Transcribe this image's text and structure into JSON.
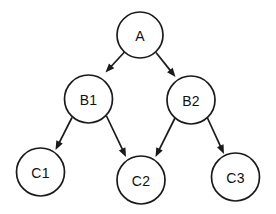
{
  "diagram": {
    "background_color": "#ffffff",
    "stroke_color": "#1a1a1a",
    "label_color": "#111111",
    "node_fill": "#ffffff",
    "stroke_width": 1.7,
    "nodes": [
      {
        "id": "A",
        "label": "A",
        "cx": 140,
        "cy": 35,
        "r": 23
      },
      {
        "id": "B1",
        "label": "B1",
        "cx": 88.5,
        "cy": 99,
        "r": 24
      },
      {
        "id": "B2",
        "label": "B2",
        "cx": 191,
        "cy": 100,
        "r": 24
      },
      {
        "id": "C1",
        "label": "C1",
        "cx": 40.5,
        "cy": 172,
        "r": 24
      },
      {
        "id": "C2",
        "label": "C2",
        "cx": 141,
        "cy": 180,
        "r": 24
      },
      {
        "id": "C3",
        "label": "C3",
        "cx": 235.5,
        "cy": 177,
        "r": 24
      }
    ],
    "edges": [
      {
        "id": "a-b1",
        "from": "A",
        "to": "B1",
        "x1": 124.5,
        "y1": 52,
        "x2": 105.5,
        "y2": 72.5
      },
      {
        "id": "a-b2",
        "from": "A",
        "to": "B2",
        "x1": 156,
        "y1": 52.5,
        "x2": 175.5,
        "y2": 77
      },
      {
        "id": "b1-c1",
        "from": "B1",
        "to": "C1",
        "x1": 72,
        "y1": 117.5,
        "x2": 55.5,
        "y2": 150
      },
      {
        "id": "b1-c2",
        "from": "B1",
        "to": "C2",
        "x1": 106.5,
        "y1": 116,
        "x2": 126,
        "y2": 157
      },
      {
        "id": "b2-c2",
        "from": "B2",
        "to": "C2",
        "x1": 175,
        "y1": 118,
        "x2": 155.5,
        "y2": 157
      },
      {
        "id": "b2-c3",
        "from": "B2",
        "to": "C3",
        "x1": 207,
        "y1": 117,
        "x2": 224,
        "y2": 154
      }
    ],
    "arrow_size": {
      "length": 9,
      "half_width": 3.6
    }
  }
}
